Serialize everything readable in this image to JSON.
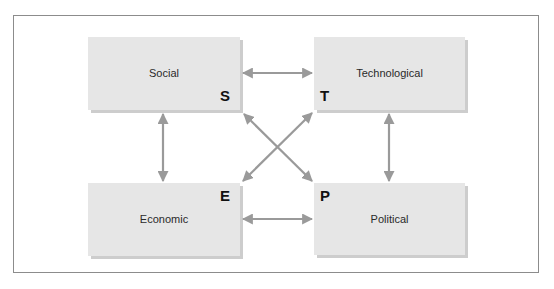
{
  "diagram": {
    "type": "PEST analysis",
    "colors": {
      "box_fill": "#e6e6e6",
      "box_shadow": "#cdcdcd",
      "arrow": "#9a9a9a",
      "frame_border": "#8c8c8c",
      "letter": "#111111",
      "label": "#2a2a2a"
    },
    "nodes": [
      {
        "id": "social",
        "label": "Social",
        "letter": "S",
        "position": "top-left"
      },
      {
        "id": "technological",
        "label": "Technological",
        "letter": "T",
        "position": "top-right"
      },
      {
        "id": "economic",
        "label": "Economic",
        "letter": "E",
        "position": "bottom-left"
      },
      {
        "id": "political",
        "label": "Political",
        "letter": "P",
        "position": "bottom-right"
      }
    ],
    "edges": [
      {
        "from": "social",
        "to": "technological",
        "direction": "bidirectional"
      },
      {
        "from": "social",
        "to": "economic",
        "direction": "bidirectional"
      },
      {
        "from": "technological",
        "to": "political",
        "direction": "bidirectional"
      },
      {
        "from": "economic",
        "to": "political",
        "direction": "bidirectional"
      },
      {
        "from": "social",
        "to": "political",
        "direction": "bidirectional"
      },
      {
        "from": "technological",
        "to": "economic",
        "direction": "bidirectional"
      }
    ]
  }
}
